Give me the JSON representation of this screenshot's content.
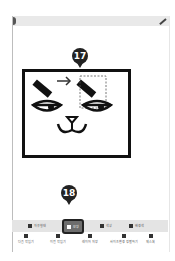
{
  "markers": {
    "step17": "17",
    "step18": "18"
  },
  "toolbar": {
    "tools": [
      {
        "label": "자유형태",
        "icon": "freeform-icon"
      },
      {
        "label": "모양",
        "icon": "shape-icon",
        "selected": true
      },
      {
        "label": "색상",
        "icon": "color-icon"
      },
      {
        "label": "배경색",
        "icon": "background-icon"
      }
    ]
  },
  "bottom_nav": {
    "items": [
      {
        "label": "다음 작업기",
        "icon": "next-icon"
      },
      {
        "label": "이전 작업기",
        "icon": "previous-icon"
      },
      {
        "label": "레이어 저장",
        "icon": "save-icon"
      },
      {
        "label": "사이즈변경 정렬하기",
        "icon": "resize-icon"
      },
      {
        "label": "제스처",
        "icon": "gesture-icon"
      }
    ]
  },
  "colors": {
    "marker": "#222222",
    "selected_tool_bg": "#6d6d6d",
    "toolbar_bg": "#e4e4e4",
    "topbar_bg": "#e9e9e9"
  }
}
